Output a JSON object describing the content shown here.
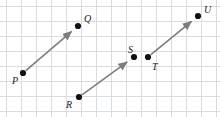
{
  "figure": {
    "width": 220,
    "height": 117,
    "background_color": "#ffffff"
  },
  "grid": {
    "line_color": "#d8dce3",
    "cell_size": 15,
    "origin_x": 6,
    "origin_y": 6,
    "columns": 14,
    "rows": 7,
    "show": true
  },
  "style": {
    "segment_color": "#7d7d80",
    "segment_width": 1.6,
    "point_color": "#111111",
    "point_radius": 3.1,
    "label_color": "#1b1b1b",
    "label_font_size": 10
  },
  "points": [
    {
      "id": "P",
      "label": "P",
      "x": 23,
      "y": 73,
      "label_x": 12,
      "label_y": 76,
      "label_anchor": "left-below"
    },
    {
      "id": "Q",
      "label": "Q",
      "x": 78,
      "y": 26,
      "label_x": 84,
      "label_y": 14,
      "label_anchor": "right-above"
    },
    {
      "id": "R",
      "label": "R",
      "x": 79,
      "y": 97,
      "label_x": 66,
      "label_y": 100,
      "label_anchor": "left-below"
    },
    {
      "id": "S",
      "label": "S",
      "x": 134,
      "y": 57,
      "label_x": 128,
      "label_y": 45,
      "label_anchor": "left-above"
    },
    {
      "id": "T",
      "label": "T",
      "x": 148,
      "y": 57,
      "label_x": 152,
      "label_y": 62,
      "label_anchor": "right-below"
    },
    {
      "id": "U",
      "label": "U",
      "x": 198,
      "y": 16,
      "label_x": 204,
      "label_y": 5,
      "label_anchor": "right-above"
    }
  ],
  "vectors": [
    {
      "id": "PQ",
      "name": "vector-p-q",
      "from": "P",
      "to": "Q",
      "arrowhead": true
    },
    {
      "id": "RS",
      "name": "vector-r-s",
      "from": "R",
      "to": "S",
      "arrowhead": true
    },
    {
      "id": "TU",
      "name": "vector-t-u",
      "from": "T",
      "to": "U",
      "arrowhead": true
    }
  ]
}
